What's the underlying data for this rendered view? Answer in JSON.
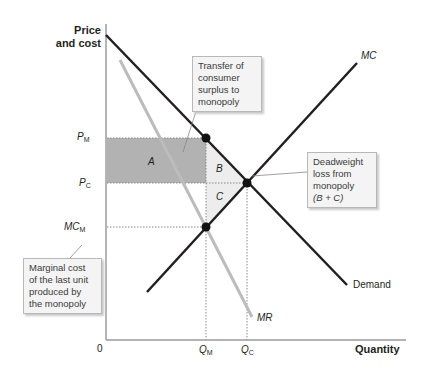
{
  "axes": {
    "y_label_line1": "Price",
    "y_label_line2": "and cost",
    "x_label": "Quantity",
    "origin": "0"
  },
  "ticks": {
    "y": [
      {
        "main": "P",
        "sub": "M"
      },
      {
        "main": "P",
        "sub": "C"
      },
      {
        "main": "MC",
        "sub": "M"
      }
    ],
    "x": [
      {
        "main": "Q",
        "sub": "M"
      },
      {
        "main": "Q",
        "sub": "C"
      }
    ]
  },
  "curves": {
    "demand": "Demand",
    "mc": "MC",
    "mr": "MR"
  },
  "regions": {
    "a": "A",
    "b": "B",
    "c": "C"
  },
  "callouts": {
    "transfer": [
      "Transfer of",
      "consumer",
      "surplus to",
      "monopoly"
    ],
    "deadweight": [
      "Deadweight",
      "loss from",
      "monopoly",
      "(B + C)"
    ],
    "marginal": [
      "Marginal cost",
      "of the last unit",
      "produced by",
      "the monopoly"
    ]
  },
  "colors": {
    "demand": "#231f20",
    "mc": "#231f20",
    "mr": "#b8b8b8",
    "region_a": "#a8a8a8",
    "region_bc": "#ececec",
    "axis": "#555555"
  }
}
